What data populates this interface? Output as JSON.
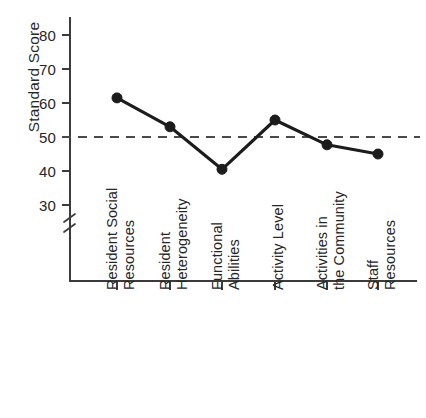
{
  "chart_data": {
    "type": "line",
    "title": "",
    "xlabel": "",
    "ylabel": "Standard Score",
    "ylim": [
      26,
      84
    ],
    "yticks": [
      30,
      40,
      50,
      60,
      70,
      80
    ],
    "ytick_labels": [
      "30",
      "40",
      "50",
      "60",
      "70",
      "80"
    ],
    "grid": false,
    "legend": "none",
    "axis_break": true,
    "axis_break_note": "y-axis broken below 30",
    "categories": [
      "Resident Social Resources",
      "Resident Heterogeneity",
      "Functional Abilities",
      "Activity Level",
      "Activities in the Community",
      "Staff Resources"
    ],
    "category_lines": [
      [
        "Resident Social",
        "Resources"
      ],
      [
        "Resident",
        "Heterogeneity"
      ],
      [
        "Functional",
        "Abilities"
      ],
      [
        "Activity Level",
        ""
      ],
      [
        "Activities in",
        "the Community"
      ],
      [
        "Staff",
        "Resources"
      ]
    ],
    "values": [
      61.5,
      53.0,
      40.5,
      55.0,
      47.7,
      45.0
    ],
    "series": [
      {
        "name": "Standard Score",
        "values": [
          61.5,
          53.0,
          40.5,
          55.0,
          47.7,
          45.0
        ],
        "color": "#1c1c1c",
        "marker": "filled-circle"
      }
    ],
    "reference_line": {
      "value": 50,
      "style": "dashed",
      "color": "#4a4a4a"
    }
  },
  "figure": {
    "background_color": "#ffffff",
    "axis_color": "#3b3b3b",
    "text_color": "#262626"
  }
}
